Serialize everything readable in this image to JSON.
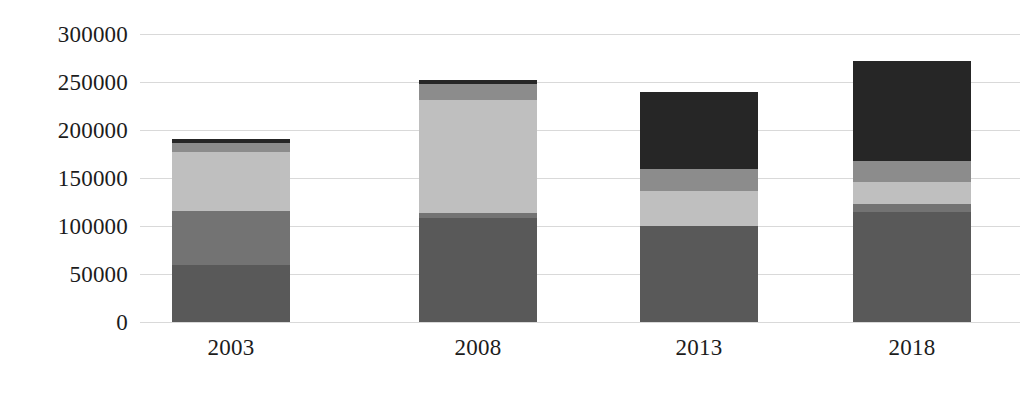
{
  "chart_data": {
    "type": "bar",
    "subtype": "stacked-vertical",
    "title": "",
    "subtitle": "",
    "xlabel": "",
    "ylabel": "",
    "categories": [
      "2003",
      "2008",
      "2013",
      "2018"
    ],
    "ytick_labels": [
      "0",
      "50000",
      "100000",
      "150000",
      "200000",
      "250000",
      "300000"
    ],
    "ytick_values": [
      0,
      50000,
      100000,
      150000,
      200000,
      250000,
      300000
    ],
    "ylim": [
      0,
      300000
    ],
    "grid": true,
    "grid_axis": "y",
    "legend": false,
    "legend_position": "none",
    "data_labels": false,
    "series": [
      {
        "name": "Series 1",
        "color": "#595959",
        "values": [
          59000,
          108000,
          100000,
          115000
        ]
      },
      {
        "name": "Series 2",
        "color": "#737373",
        "values": [
          57000,
          6000,
          0,
          8000
        ]
      },
      {
        "name": "Series 3",
        "color": "#bfbfbf",
        "values": [
          61000,
          117000,
          36000,
          23000
        ]
      },
      {
        "name": "Series 4",
        "color": "#8c8c8c",
        "values": [
          10000,
          17000,
          23000,
          22000
        ]
      },
      {
        "name": "Series 5",
        "color": "#262626",
        "values": [
          4000,
          4000,
          81000,
          104000
        ]
      }
    ],
    "totals": [
      191000,
      252000,
      240000,
      272000
    ],
    "colors": {
      "gridline": "#d9d9d9",
      "axis_text": "#1c1c1c",
      "background": "#ffffff"
    }
  },
  "layout": {
    "bar_width_px": 118,
    "bar_centers_px": [
      231,
      478,
      699,
      912
    ],
    "baseline_y_px": 322,
    "top_y_px": 34,
    "plot_left_px": 140,
    "plot_width_px": 880
  }
}
